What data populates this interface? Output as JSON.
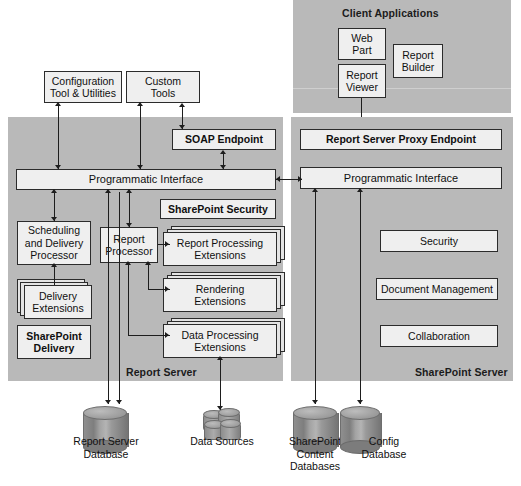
{
  "diagram": {
    "colors": {
      "panel_gray": "#b9b9b9",
      "box_fill": "#efefef",
      "box_border": "#2b2b2b",
      "connector": "#1d1d1d",
      "cylinder": "#8f8f8f"
    }
  },
  "client_applications": {
    "label": "Client Applications",
    "boxes": [
      {
        "label": "Web\nPart"
      },
      {
        "label": "Report\nBuilder"
      },
      {
        "label": "Report\nViewer"
      }
    ]
  },
  "external_tools": [
    {
      "label": "Configuration\nTool & Utilities"
    },
    {
      "label": "Custom\nTools"
    }
  ],
  "report_server": {
    "label": "Report Server",
    "endpoint": {
      "label": "SOAP Endpoint"
    },
    "programmatic_interface": {
      "label": "Programmatic Interface"
    },
    "sharepoint_security": {
      "label": "SharePoint Security"
    },
    "scheduling_processor": {
      "label": "Scheduling\nand Delivery\nProcessor"
    },
    "delivery_extensions": {
      "label": "Delivery\nExtensions"
    },
    "sharepoint_delivery": {
      "label": "SharePoint\nDelivery"
    },
    "report_processor": {
      "label": "Report\nProcessor"
    },
    "extensions": [
      {
        "label": "Report Processing\nExtensions"
      },
      {
        "label": "Rendering\nExtensions"
      },
      {
        "label": "Data Processing\nExtensions"
      }
    ]
  },
  "sharepoint_server": {
    "label": "SharePoint Server",
    "proxy_endpoint": {
      "label": "Report Server Proxy Endpoint"
    },
    "programmatic_interface": {
      "label": "Programmatic Interface"
    },
    "services": [
      {
        "label": "Security"
      },
      {
        "label": "Document Management"
      },
      {
        "label": "Collaboration"
      }
    ]
  },
  "data_stores": [
    {
      "label": "Report Server\nDatabase",
      "kind": "cylinder"
    },
    {
      "label": "Data Sources",
      "kind": "cluster"
    },
    {
      "label": "SharePoint\nContent\nDatabases",
      "kind": "cylinder"
    },
    {
      "label": "Config\nDatabase",
      "kind": "cylinder"
    }
  ]
}
